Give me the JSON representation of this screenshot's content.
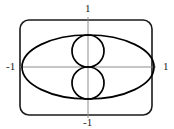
{
  "figure": {
    "title": "",
    "background_color": "#ffffff",
    "curve_color": "#000000",
    "axis_color": "#8c8c8c",
    "frame_color": "#1a1a1a",
    "label_color": "#1a1a1a",
    "labels": {
      "top": "1",
      "left": "-1",
      "right": "1",
      "bottom": "-1"
    },
    "frame": {
      "name": "rounded-rectangle-border",
      "x": 20,
      "y": 20,
      "width": 132,
      "height": 95,
      "corner_radius": 9,
      "stroke_width": 1.6
    },
    "axes": {
      "x_axis": {
        "x1": 20,
        "y1": 67,
        "x2": 156,
        "y2": 67
      },
      "y_axis": {
        "x1": 88,
        "y1": 17,
        "x2": 88,
        "y2": 118
      },
      "stroke_width": 1
    }
  },
  "chart_data": {
    "type": "line",
    "title": "",
    "xlabel": "",
    "ylabel": "",
    "xlim": [
      -1.2,
      1.2
    ],
    "ylim": [
      -1.2,
      1.2
    ],
    "grid": false,
    "legend": null,
    "xticks": [
      -1,
      1
    ],
    "xticklabels": [
      "-1",
      "1"
    ],
    "yticks": [
      -1,
      1
    ],
    "yticklabels": [
      "-1",
      "1"
    ],
    "origin_px": {
      "x": 88,
      "y": 67
    },
    "scale_px": {
      "x_unit": 66,
      "y_unit": 32
    },
    "series": [
      {
        "name": "outer-ellipse",
        "shape": "ellipse",
        "center": [
          0,
          0
        ],
        "semi_axis_x": 1.0,
        "semi_axis_y": 1.0,
        "center_px": [
          88,
          67
        ],
        "rx_px": 66,
        "ry_px": 32,
        "stroke": "#000000",
        "stroke_width": 1.7,
        "fill": "none"
      },
      {
        "name": "upper-circle",
        "shape": "circle",
        "center": [
          0,
          0.5
        ],
        "radius": 0.5,
        "center_px": [
          88,
          51
        ],
        "rx_px": 16,
        "ry_px": 16,
        "stroke": "#000000",
        "stroke_width": 1.7,
        "fill": "none"
      },
      {
        "name": "lower-circle",
        "shape": "circle",
        "center": [
          0,
          -0.5
        ],
        "radius": 0.5,
        "center_px": [
          88,
          83
        ],
        "rx_px": 16,
        "ry_px": 16,
        "stroke": "#000000",
        "stroke_width": 1.7,
        "fill": "none"
      }
    ],
    "annotations": [
      {
        "text": "1",
        "position": "top",
        "x": 0,
        "y": 1
      },
      {
        "text": "-1",
        "position": "left",
        "x": -1,
        "y": 0
      },
      {
        "text": "1",
        "position": "right",
        "x": 1,
        "y": 0
      },
      {
        "text": "-1",
        "position": "bottom",
        "x": 0,
        "y": -1
      }
    ]
  }
}
